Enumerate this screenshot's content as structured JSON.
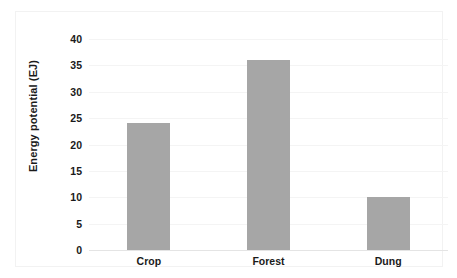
{
  "chart_data": {
    "type": "bar",
    "title": "",
    "xlabel": "",
    "ylabel": "Energy potential (EJ)",
    "categories": [
      "Crop",
      "Forest",
      "Dung"
    ],
    "values": [
      24,
      36,
      10
    ],
    "ylim": [
      0,
      40
    ],
    "yticks": [
      0,
      5,
      10,
      15,
      20,
      25,
      30,
      35,
      40
    ],
    "ytick_labels": [
      "0",
      "5",
      "10",
      "15",
      "20",
      "25",
      "30",
      "35",
      "40"
    ],
    "grid": true,
    "legend": false,
    "bar_color": "#a6a6a6",
    "gridline_color": "#f4f4f4",
    "axis_color": "#e4e4e4",
    "text_color": "#1a1a1a"
  }
}
